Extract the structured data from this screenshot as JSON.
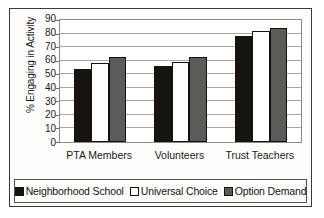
{
  "chart_data": {
    "type": "bar",
    "title": "",
    "subtitle": "",
    "xlabel": "",
    "ylabel": "% Engaging in Activity",
    "categories": [
      "PTA Members",
      "Volunteers",
      "Trust Teachers"
    ],
    "series": [
      {
        "name": "Neighborhood School",
        "color": "#17130f",
        "values": [
          54,
          56,
          78
        ]
      },
      {
        "name": "Universal Choice",
        "color": "#ffffff",
        "values": [
          58,
          59,
          82
        ]
      },
      {
        "name": "Option Demand",
        "color": "#5b5b58",
        "values": [
          63,
          63,
          84
        ]
      }
    ],
    "ylim": [
      0,
      90
    ],
    "ytick_step": 10,
    "yticks": [
      "90",
      "80",
      "70",
      "60",
      "50",
      "40",
      "30",
      "20",
      "10",
      "0"
    ],
    "grid": true,
    "legend_position": "bottom"
  }
}
